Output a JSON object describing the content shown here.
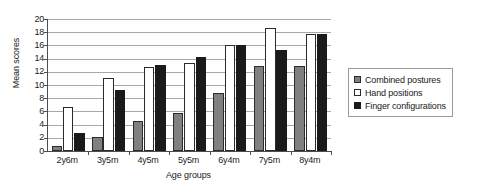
{
  "chart_data": {
    "type": "bar",
    "title": "",
    "xlabel": "Age groups",
    "ylabel": "Mean scores",
    "ylim": [
      0,
      20
    ],
    "ytick_step": 2,
    "yticks": [
      0,
      2,
      4,
      6,
      8,
      10,
      12,
      14,
      16,
      18,
      20
    ],
    "ytick_labels": [
      "0",
      "2",
      "4",
      "6",
      "8",
      "10",
      "12",
      "14",
      "16",
      "18",
      "20"
    ],
    "grid": true,
    "grid_axis": "y",
    "legend_position": "right",
    "categories": [
      "2y6m",
      "3y5m",
      "4y5m",
      "5y5m",
      "6y4m",
      "7y5m",
      "8y4m"
    ],
    "series": [
      {
        "name": "Combined postures",
        "color": "#808080",
        "values": [
          0.8,
          2.1,
          4.6,
          5.8,
          8.8,
          12.9,
          12.9
        ]
      },
      {
        "name": "Hand positions",
        "color": "#ffffff",
        "values": [
          6.6,
          11.1,
          12.8,
          13.4,
          16.1,
          18.6,
          17.7
        ]
      },
      {
        "name": "Finger configurations",
        "color": "#1a1a1a",
        "values": [
          2.8,
          9.2,
          13.1,
          14.2,
          16.1,
          15.3,
          17.8
        ]
      }
    ]
  },
  "legend": {
    "items": [
      {
        "label": "Combined postures"
      },
      {
        "label": "Hand positions"
      },
      {
        "label": "Finger configurations"
      }
    ]
  }
}
